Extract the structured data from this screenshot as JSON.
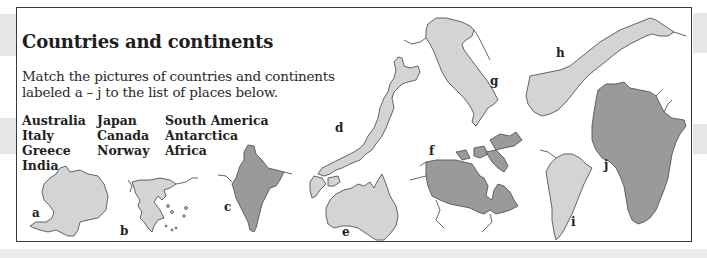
{
  "worksheet": {
    "title": "Countries and continents",
    "instructions": "Match the pictures of countries and continents labeled a – j to the list of places below.",
    "places": {
      "column1": [
        "Australia",
        "Italy",
        "Greece",
        "India"
      ],
      "column2": [
        "Japan",
        "Canada",
        "Norway"
      ],
      "column3": [
        "South America",
        "Antarctica",
        "Africa"
      ]
    },
    "map_labels": {
      "a": "a",
      "b": "b",
      "c": "c",
      "d": "d",
      "e": "e",
      "f": "f",
      "g": "g",
      "h": "h",
      "i": "i",
      "j": "j"
    },
    "colors": {
      "light_fill": "#d4d4d4",
      "dark_fill": "#9a9a9a",
      "outline": "#555555",
      "frame_border": "#3a3a3a",
      "margin_gray": "#e6e6e6"
    }
  }
}
